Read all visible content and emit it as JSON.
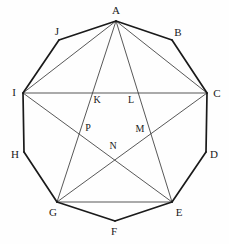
{
  "figure": {
    "shape": "decagon",
    "stroke_color": "#1a1a1a",
    "chord_color": "#3a3a3a",
    "background": "#fefefe",
    "outer_vertices": [
      {
        "name": "A",
        "x": 116,
        "y": 21,
        "label_x": 116,
        "label_y": 10
      },
      {
        "name": "B",
        "x": 172,
        "y": 40,
        "label_x": 178,
        "label_y": 32
      },
      {
        "name": "C",
        "x": 207,
        "y": 93,
        "label_x": 217,
        "label_y": 93
      },
      {
        "name": "D",
        "x": 206,
        "y": 152,
        "label_x": 214,
        "label_y": 154
      },
      {
        "name": "E",
        "x": 172,
        "y": 202,
        "label_x": 179,
        "label_y": 212
      },
      {
        "name": "F",
        "x": 115,
        "y": 221,
        "label_x": 114,
        "label_y": 231
      },
      {
        "name": "G",
        "x": 57,
        "y": 202,
        "label_x": 53,
        "label_y": 212
      },
      {
        "name": "H",
        "x": 24,
        "y": 152,
        "label_x": 15,
        "label_y": 154
      },
      {
        "name": "I",
        "x": 23,
        "y": 93,
        "label_x": 14,
        "label_y": 92
      },
      {
        "name": "J",
        "x": 59,
        "y": 40,
        "label_x": 57,
        "label_y": 31
      }
    ],
    "interior_points": [
      {
        "name": "K",
        "x": 90,
        "y": 94,
        "label_x": 97,
        "label_y": 100
      },
      {
        "name": "L",
        "x": 140,
        "y": 94,
        "label_x": 131,
        "label_y": 100
      },
      {
        "name": "P",
        "x": 81,
        "y": 130,
        "label_x": 88,
        "label_y": 128
      },
      {
        "name": "M",
        "x": 148,
        "y": 130,
        "label_x": 140,
        "label_y": 129
      },
      {
        "name": "N",
        "x": 115,
        "y": 155,
        "label_x": 113,
        "label_y": 146
      }
    ],
    "outer_edges": [
      [
        "A",
        "B"
      ],
      [
        "B",
        "C"
      ],
      [
        "C",
        "D"
      ],
      [
        "D",
        "E"
      ],
      [
        "E",
        "F"
      ],
      [
        "F",
        "G"
      ],
      [
        "G",
        "H"
      ],
      [
        "H",
        "I"
      ],
      [
        "I",
        "J"
      ],
      [
        "J",
        "A"
      ]
    ],
    "chords": [
      [
        "A",
        "C"
      ],
      [
        "A",
        "E"
      ],
      [
        "A",
        "G"
      ],
      [
        "A",
        "I"
      ],
      [
        "I",
        "C"
      ],
      [
        "I",
        "E"
      ],
      [
        "C",
        "G"
      ],
      [
        "G",
        "E"
      ]
    ]
  }
}
